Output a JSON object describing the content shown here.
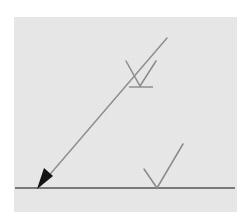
{
  "figure": {
    "canvas": {
      "width": 249,
      "height": 223,
      "page_background": "#ffffff"
    },
    "panel": {
      "name": "diagram-panel",
      "x": 14,
      "y": 17,
      "width": 223,
      "height": 195,
      "fill": "#e8e8e8"
    },
    "colors": {
      "page_background": "#ffffff",
      "panel_background": "#e8e8e8",
      "baseline_stroke": "#555555",
      "ray_stroke": "#8f8f8f",
      "chevron_stroke": "#8a8a8a",
      "tick_stroke": "#8a8a8a",
      "arrowhead_fill": "#111111"
    },
    "strokes": {
      "baseline_width": 1.6,
      "ray_width": 1.5,
      "chevron_width": 1.5,
      "tick_width": 1.4
    },
    "elements": {
      "baseline": {
        "name": "baseline-surface",
        "x1": 15,
        "y1": 188,
        "x2": 235,
        "y2": 188
      },
      "ray": {
        "name": "incident-ray",
        "x1": 40,
        "y1": 186,
        "x2": 167,
        "y2": 38
      },
      "arrowhead": {
        "name": "ray-arrowhead",
        "tip_x": 37,
        "tip_y": 189,
        "points": "37,189 44,168 53,176"
      },
      "upper_chevron": {
        "name": "upper-chevron-mark",
        "left_x": 126,
        "left_y": 61,
        "vertex_x": 140,
        "vertex_y": 86,
        "right_x": 156,
        "right_y": 61
      },
      "upper_tick": {
        "name": "upper-tick-mark",
        "x1": 129,
        "y1": 87,
        "x2": 153,
        "y2": 87
      },
      "lower_chevron": {
        "name": "lower-chevron-mark",
        "left_x": 144,
        "left_y": 169,
        "vertex_x": 157,
        "vertex_y": 188,
        "right_x": 183,
        "right_y": 144
      }
    }
  }
}
